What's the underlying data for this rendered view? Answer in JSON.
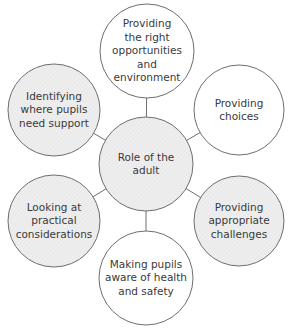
{
  "diagram": {
    "type": "spider",
    "colors": {
      "stroke": "#6e6e6e",
      "white_fill": "#ffffff",
      "grey_fill": "#ececec",
      "text": "#3a3a3a"
    },
    "center": {
      "id": "role",
      "label": "Role of the\nadult",
      "fill": "grey",
      "cx": 146,
      "cy": 164,
      "r": 47
    },
    "nodes": [
      {
        "id": "opportunities",
        "label": "Providing\nthe right\nopportunities\nand\nenvironment",
        "fill": "white",
        "cx": 147,
        "cy": 51,
        "r": 47
      },
      {
        "id": "choices",
        "label": "Providing\nchoices",
        "fill": "white",
        "cx": 239,
        "cy": 110,
        "r": 45
      },
      {
        "id": "challenges",
        "label": "Providing\nappropriate\nchallenges",
        "fill": "grey",
        "cx": 239,
        "cy": 221,
        "r": 45
      },
      {
        "id": "health",
        "label": "Making pupils\naware of health\nand safety",
        "fill": "white",
        "cx": 146,
        "cy": 278,
        "r": 47
      },
      {
        "id": "practical",
        "label": "Looking at\npractical\nconsiderations",
        "fill": "grey",
        "cx": 54,
        "cy": 221,
        "r": 46
      },
      {
        "id": "support",
        "label": "Identifying\nwhere pupils\nneed support",
        "fill": "grey",
        "cx": 54,
        "cy": 110,
        "r": 46
      }
    ]
  }
}
